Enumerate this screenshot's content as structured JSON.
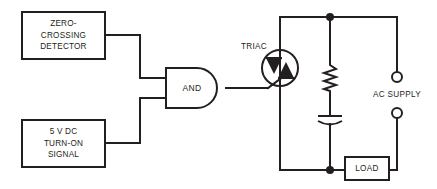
{
  "diagram": {
    "colors": {
      "line": "#231f20",
      "background": "#ffffff"
    }
  },
  "blocks": {
    "zero_crossing_detector": {
      "name": "zero-crossing-detector-block",
      "lines": [
        "ZERO-",
        "CROSSING",
        "DETECTOR"
      ]
    },
    "turn_on_signal": {
      "name": "turn-on-signal-block",
      "lines": [
        "5 V DC",
        "TURN-ON",
        "SIGNAL"
      ]
    },
    "and_gate": {
      "name": "and-gate",
      "label": "AND"
    },
    "load": {
      "name": "load-block",
      "label": "LOAD"
    }
  },
  "components": {
    "triac": {
      "name": "triac-symbol",
      "label": "TRIAC"
    },
    "resistor": {
      "name": "resistor-symbol",
      "label": ""
    },
    "capacitor": {
      "name": "capacitor-symbol",
      "label": ""
    },
    "ac_supply": {
      "name": "ac-supply-terminals",
      "label": "AC SUPPLY"
    }
  }
}
